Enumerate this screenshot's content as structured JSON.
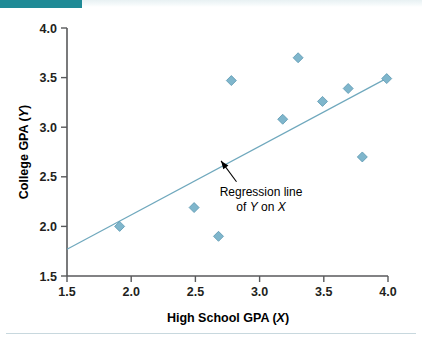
{
  "figure": {
    "header_bar_color": "#1f8a96",
    "background_color": "#ffffff",
    "marker_color": "#7fb6cc",
    "line_color": "#6fa8bd",
    "axis_color": "#58595b"
  },
  "chart_data": {
    "type": "scatter",
    "title": "",
    "xlabel": "High School GPA (X)",
    "xlabel_main": "High School GPA (",
    "xlabel_var": "X",
    "xlabel_close": ")",
    "ylabel": "College GPA (Y)",
    "ylabel_main": "College GPA (",
    "ylabel_var": "Y",
    "ylabel_close": ")",
    "xlim": [
      1.5,
      4.0
    ],
    "ylim": [
      1.5,
      4.0
    ],
    "xticks": [
      "1.5",
      "2.0",
      "2.5",
      "3.0",
      "3.5",
      "4.0"
    ],
    "xtick_values": [
      1.5,
      2.0,
      2.5,
      3.0,
      3.5,
      4.0
    ],
    "yticks": [
      "1.5",
      "2.0",
      "2.5",
      "3.0",
      "3.5",
      "4.0"
    ],
    "ytick_values": [
      1.5,
      2.0,
      2.5,
      3.0,
      3.5,
      4.0
    ],
    "grid": false,
    "legend": false,
    "points": [
      {
        "x": 1.91,
        "y": 2.0
      },
      {
        "x": 2.49,
        "y": 2.19
      },
      {
        "x": 2.68,
        "y": 1.9
      },
      {
        "x": 2.78,
        "y": 3.47
      },
      {
        "x": 3.18,
        "y": 3.08
      },
      {
        "x": 3.3,
        "y": 3.7
      },
      {
        "x": 3.49,
        "y": 3.26
      },
      {
        "x": 3.69,
        "y": 3.39
      },
      {
        "x": 3.8,
        "y": 2.7
      },
      {
        "x": 3.99,
        "y": 3.49
      }
    ],
    "regression_line": {
      "x_start": 1.5,
      "y_start": 1.77,
      "x_end": 4.0,
      "y_end": 3.5
    },
    "annotations": [
      {
        "line1": "Regression line",
        "line2_prefix": "of ",
        "line2_var1": "Y",
        "line2_mid": " on ",
        "line2_var2": "X",
        "arrow_from_x": 2.82,
        "arrow_from_y": 2.45,
        "arrow_to_x": 2.7,
        "arrow_to_y": 2.66
      }
    ]
  }
}
